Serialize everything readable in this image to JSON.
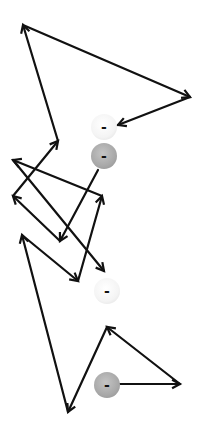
{
  "diagram": {
    "title": "",
    "charges": [
      {
        "id": "c1",
        "sign": "-",
        "shade": "light",
        "x": 104,
        "y": 127
      },
      {
        "id": "c2",
        "sign": "-",
        "shade": "dark",
        "x": 104,
        "y": 156
      },
      {
        "id": "c3",
        "sign": "-",
        "shade": "light",
        "x": 107,
        "y": 291
      },
      {
        "id": "c4",
        "sign": "-",
        "shade": "dark",
        "x": 107,
        "y": 385
      }
    ],
    "arrows": [
      {
        "from": [
          58,
          141
        ],
        "to": [
          23,
          25
        ]
      },
      {
        "from": [
          23,
          25
        ],
        "to": [
          190,
          97
        ]
      },
      {
        "from": [
          190,
          97
        ],
        "to": [
          118,
          125
        ]
      },
      {
        "from": [
          98,
          170
        ],
        "to": [
          60,
          241
        ]
      },
      {
        "from": [
          60,
          241
        ],
        "to": [
          13,
          196
        ]
      },
      {
        "from": [
          13,
          196
        ],
        "to": [
          58,
          141
        ]
      },
      {
        "from": [
          102,
          196
        ],
        "to": [
          13,
          160
        ]
      },
      {
        "from": [
          13,
          160
        ],
        "to": [
          104,
          271
        ]
      },
      {
        "from": [
          78,
          281
        ],
        "to": [
          102,
          196
        ]
      },
      {
        "from": [
          22,
          235
        ],
        "to": [
          78,
          281
        ]
      },
      {
        "from": [
          68,
          412
        ],
        "to": [
          22,
          235
        ]
      },
      {
        "from": [
          107,
          327
        ],
        "to": [
          68,
          412
        ]
      },
      {
        "from": [
          180,
          384
        ],
        "to": [
          107,
          327
        ]
      },
      {
        "from": [
          120,
          384
        ],
        "to": [
          180,
          384
        ]
      }
    ],
    "colors": {
      "line": "#111111"
    }
  }
}
